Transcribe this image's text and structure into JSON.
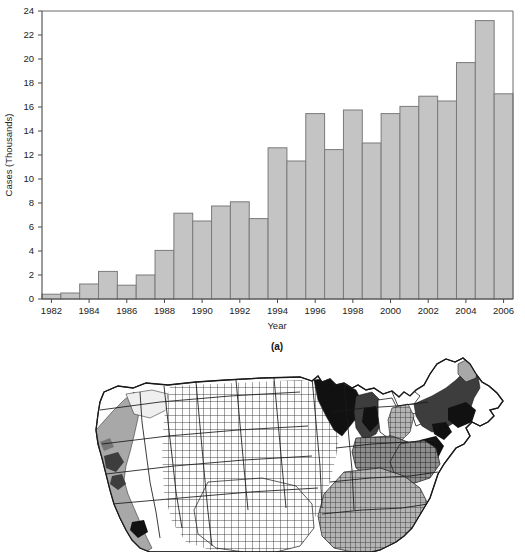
{
  "figure": {
    "panel_a_label": "(a)",
    "panel_a_caption": "(a)"
  },
  "chart_data": {
    "type": "bar",
    "title": "",
    "subtitle": "",
    "xlabel": "Year",
    "ylabel": "Cases (Thousands)",
    "grid": false,
    "legend": "none",
    "xlim": [
      1981.5,
      2006.5
    ],
    "ylim": [
      0,
      24
    ],
    "ytick_values": [
      0,
      2,
      4,
      6,
      8,
      10,
      12,
      14,
      16,
      18,
      20,
      22,
      24
    ],
    "ytick_labels": [
      "0",
      "2",
      "4",
      "6",
      "8",
      "10",
      "12",
      "14",
      "16",
      "18",
      "20",
      "22",
      "24"
    ],
    "xtick_values": [
      1982,
      1984,
      1986,
      1988,
      1990,
      1992,
      1994,
      1996,
      1998,
      2000,
      2002,
      2004,
      2006
    ],
    "xtick_labels": [
      "1982",
      "1984",
      "1986",
      "1988",
      "1990",
      "1992",
      "1994",
      "1996",
      "1998",
      "2000",
      "2002",
      "2004",
      "2006"
    ],
    "categories": [
      1982,
      1983,
      1984,
      1985,
      1986,
      1987,
      1988,
      1989,
      1990,
      1991,
      1992,
      1993,
      1994,
      1995,
      1996,
      1997,
      1998,
      1999,
      2000,
      2001,
      2002,
      2003,
      2004,
      2005,
      2006
    ],
    "values": [
      0.4,
      0.5,
      1.25,
      2.3,
      1.15,
      2.0,
      4.05,
      7.15,
      6.5,
      7.75,
      8.1,
      6.7,
      12.6,
      11.5,
      15.45,
      12.45,
      15.75,
      13.0,
      15.45,
      16.05,
      16.9,
      16.5,
      19.7,
      23.2,
      17.1
    ],
    "bar_color": "#c4c4c4",
    "bar_edge_color": "#7a7a7a",
    "axis_color": "#555555",
    "units": "Thousands of cases"
  },
  "map": {
    "name": "us-county-choropleth",
    "description": "County-level map of the contiguous United States",
    "palette": {
      "level_0": "#ffffff",
      "level_1": "#efefef",
      "level_2": "#cfcfcf",
      "level_3": "#a8a8a8",
      "level_4": "#767676",
      "level_5": "#3d3d3d",
      "level_6": "#111111"
    },
    "border_color": "#1a1a1a"
  }
}
